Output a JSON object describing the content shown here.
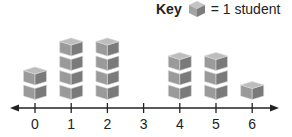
{
  "chart_data": {
    "type": "dot plot (cube stacks)",
    "title": "",
    "key": {
      "label": "Key",
      "symbol": "cube",
      "meaning": "= 1 student"
    },
    "categories": [
      "0",
      "1",
      "2",
      "3",
      "4",
      "5",
      "6"
    ],
    "values": [
      2,
      4,
      4,
      0,
      3,
      3,
      1
    ],
    "xlabel": "",
    "ylabel": "",
    "axis": "number line with arrows at both ends",
    "grid": false
  },
  "colors": {
    "cube_front": "#9a9a9a",
    "cube_side": "#7a7a7a",
    "cube_top": "#bdbdbd",
    "axis": "#222222"
  }
}
